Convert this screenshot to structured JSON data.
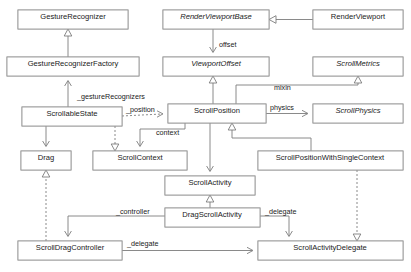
{
  "diagram": {
    "type": "uml-class-diagram",
    "colors": {
      "background": "#ffffff",
      "box_fill": "#ffffff",
      "box_stroke": "#9a9a9a",
      "compartment_fill": "#eeeeee",
      "edge_stroke": "#7d7d7d",
      "text": "#1a1a1a"
    },
    "classes": [
      {
        "id": "gestureRecognizer",
        "label": "GestureRecognizer",
        "abstract": false,
        "x": 18,
        "y": 10,
        "w": 110,
        "h": 19
      },
      {
        "id": "renderViewportBase",
        "label": "RenderViewportBase",
        "abstract": true,
        "x": 163,
        "y": 10,
        "w": 106,
        "h": 19
      },
      {
        "id": "renderViewport",
        "label": "RenderViewport",
        "abstract": false,
        "x": 313,
        "y": 10,
        "w": 90,
        "h": 19
      },
      {
        "id": "gestureRecognizerFactory",
        "label": "GestureRecognizerFactory",
        "abstract": false,
        "x": 7,
        "y": 57,
        "w": 132,
        "h": 19
      },
      {
        "id": "viewportOffset",
        "label": "ViewportOffset",
        "abstract": true,
        "x": 163,
        "y": 57,
        "w": 106,
        "h": 19
      },
      {
        "id": "scrollMetrics",
        "label": "ScrollMetrics",
        "abstract": true,
        "x": 313,
        "y": 57,
        "w": 90,
        "h": 19
      },
      {
        "id": "scrollableState",
        "label": "ScrollableState",
        "abstract": false,
        "x": 22,
        "y": 107,
        "w": 100,
        "h": 19
      },
      {
        "id": "scrollPosition",
        "label": "ScrollPosition",
        "abstract": false,
        "x": 168,
        "y": 104,
        "w": 98,
        "h": 19
      },
      {
        "id": "scrollPhysics",
        "label": "ScrollPhysics",
        "abstract": true,
        "x": 313,
        "y": 104,
        "w": 90,
        "h": 19
      },
      {
        "id": "drag",
        "label": "Drag",
        "abstract": false,
        "x": 21,
        "y": 151,
        "w": 50,
        "h": 19
      },
      {
        "id": "scrollContext",
        "label": "ScrollContext",
        "abstract": false,
        "x": 93,
        "y": 151,
        "w": 94,
        "h": 19
      },
      {
        "id": "scrollPositionWithSingleContext",
        "label": "ScrollPositionWithSingleContext",
        "abstract": false,
        "x": 258,
        "y": 151,
        "w": 145,
        "h": 19
      },
      {
        "id": "scrollActivity",
        "label": "ScrollActivity",
        "abstract": false,
        "x": 165,
        "y": 176,
        "w": 90,
        "h": 19
      },
      {
        "id": "dragScrollActivity",
        "label": "DragScrollActivity",
        "abstract": false,
        "x": 165,
        "y": 208,
        "w": 95,
        "h": 19
      },
      {
        "id": "scrollDragController",
        "label": "ScrollDragController",
        "abstract": false,
        "x": 18,
        "y": 241,
        "w": 104,
        "h": 19
      },
      {
        "id": "scrollActivityDelegate",
        "label": "ScrollActivityDelegate",
        "abstract": false,
        "x": 258,
        "y": 241,
        "w": 145,
        "h": 19
      }
    ],
    "edge_labels": [
      {
        "id": "offset",
        "text": "offset",
        "x": 219,
        "y": 45
      },
      {
        "id": "mixin",
        "text": "mixin",
        "x": 274,
        "y": 88
      },
      {
        "id": "gesture_recognizers",
        "text": "_gestureRecognizers",
        "x": 77,
        "y": 97
      },
      {
        "id": "position",
        "text": "_position",
        "x": 126,
        "y": 110
      },
      {
        "id": "physics",
        "text": "physics",
        "x": 270,
        "y": 108
      },
      {
        "id": "context",
        "text": "context",
        "x": 156,
        "y": 133
      },
      {
        "id": "controller",
        "text": "_controller",
        "x": 116,
        "y": 212
      },
      {
        "id": "delegate_drag",
        "text": "_delegate",
        "x": 265,
        "y": 212
      },
      {
        "id": "delegate_ctrl",
        "text": "_delegate",
        "x": 127,
        "y": 244
      }
    ],
    "relationships": [
      {
        "from": "gestureRecognizerFactory",
        "to": "gestureRecognizer",
        "kind": "generalization"
      },
      {
        "from": "renderViewport",
        "to": "renderViewportBase",
        "kind": "generalization"
      },
      {
        "from": "renderViewportBase",
        "to": "viewportOffset",
        "kind": "association",
        "label": "offset"
      },
      {
        "from": "scrollableState",
        "to": "gestureRecognizerFactory",
        "kind": "association",
        "label": "_gestureRecognizers"
      },
      {
        "from": "scrollableState",
        "to": "scrollPosition",
        "kind": "association",
        "label": "_position"
      },
      {
        "from": "scrollPosition",
        "to": "viewportOffset",
        "kind": "generalization"
      },
      {
        "from": "scrollPosition",
        "to": "scrollMetrics",
        "kind": "generalization",
        "label": "mixin"
      },
      {
        "from": "scrollPosition",
        "to": "scrollPhysics",
        "kind": "association",
        "label": "physics"
      },
      {
        "from": "scrollPosition",
        "to": "scrollContext",
        "kind": "association",
        "label": "context"
      },
      {
        "from": "scrollPosition",
        "to": "scrollActivity",
        "kind": "association"
      },
      {
        "from": "scrollPositionWithSingleContext",
        "to": "scrollPosition",
        "kind": "generalization"
      },
      {
        "from": "scrollableState",
        "to": "drag",
        "kind": "association"
      },
      {
        "from": "scrollableState",
        "to": "scrollContext",
        "kind": "realization"
      },
      {
        "from": "scrollDragController",
        "to": "drag",
        "kind": "realization"
      },
      {
        "from": "dragScrollActivity",
        "to": "scrollActivity",
        "kind": "generalization"
      },
      {
        "from": "dragScrollActivity",
        "to": "scrollDragController",
        "kind": "association",
        "label": "_controller"
      },
      {
        "from": "dragScrollActivity",
        "to": "scrollActivityDelegate",
        "kind": "association",
        "label": "_delegate"
      },
      {
        "from": "scrollDragController",
        "to": "scrollActivityDelegate",
        "kind": "association",
        "label": "_delegate"
      },
      {
        "from": "scrollPositionWithSingleContext",
        "to": "scrollActivityDelegate",
        "kind": "realization"
      }
    ]
  }
}
